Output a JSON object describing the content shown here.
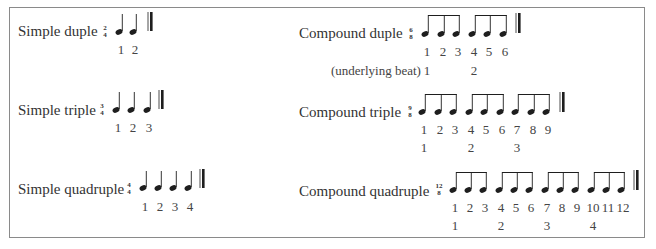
{
  "rows": [
    {
      "id": "simple-duple",
      "label": "Simple duple",
      "time_signature": {
        "top": "2",
        "bottom": "4"
      },
      "note_type": "quarter",
      "count_numbers": [
        "1",
        "2"
      ]
    },
    {
      "id": "compound-duple",
      "label": "Compound duple",
      "time_signature": {
        "top": "6",
        "bottom": "8"
      },
      "note_type": "beamed-eighths",
      "groups": 2,
      "count_numbers": [
        "1",
        "2",
        "3",
        "4",
        "5",
        "6"
      ],
      "underlying_label": "(underlying beat)",
      "underlying_beats": [
        "1",
        "2"
      ]
    },
    {
      "id": "simple-triple",
      "label": "Simple triple",
      "time_signature": {
        "top": "3",
        "bottom": "4"
      },
      "note_type": "quarter",
      "count_numbers": [
        "1",
        "2",
        "3"
      ]
    },
    {
      "id": "compound-triple",
      "label": "Compound triple",
      "time_signature": {
        "top": "9",
        "bottom": "8"
      },
      "note_type": "beamed-eighths",
      "groups": 3,
      "count_numbers": [
        "1",
        "2",
        "3",
        "4",
        "5",
        "6",
        "7",
        "8",
        "9"
      ],
      "underlying_beats": [
        "1",
        "2",
        "3"
      ]
    },
    {
      "id": "simple-quadruple",
      "label": "Simple quadruple",
      "time_signature": {
        "top": "4",
        "bottom": "4"
      },
      "note_type": "quarter",
      "count_numbers": [
        "1",
        "2",
        "3",
        "4"
      ]
    },
    {
      "id": "compound-quadruple",
      "label": "Compound quadruple",
      "time_signature": {
        "top": "12",
        "bottom": "8"
      },
      "note_type": "beamed-eighths",
      "groups": 4,
      "count_numbers": [
        "1",
        "2",
        "3",
        "4",
        "5",
        "6",
        "7",
        "8",
        "9",
        "10",
        "11",
        "12"
      ],
      "underlying_beats": [
        "1",
        "2",
        "3",
        "4"
      ]
    }
  ],
  "icons": {
    "quarter_note": "quarter-note-icon",
    "eighth_note_group": "beamed-eighth-notes-icon",
    "final_barline": "final-barline-icon"
  }
}
